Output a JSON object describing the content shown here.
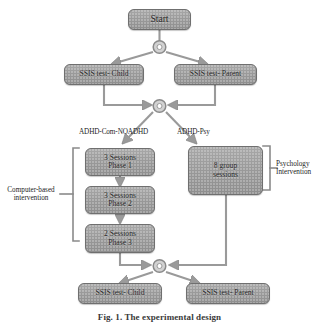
{
  "figure": {
    "caption": "Fig. 1. The experimental design",
    "type": "flowchart",
    "orientation": "top-to-bottom"
  },
  "palette": {
    "node_fill": "#9a9a9a",
    "node_border": "#6f6f6f",
    "connector": "#8f8f8f",
    "text": "#1d1d1d",
    "background": "#ffffff"
  },
  "nodes": {
    "start": {
      "label": "Start"
    },
    "ssis_child_pre": {
      "label": "SSIS test- Child"
    },
    "ssis_parent_pre": {
      "label": "SSIS test- Parent"
    },
    "phase1": {
      "line1": "3 Sessions",
      "line2": "Phase 1"
    },
    "phase2": {
      "line1": "3 Sessions",
      "line2": "Phase 2"
    },
    "phase3": {
      "line1": "2 Sessions",
      "line2": "Phase 3"
    },
    "group_sessions": {
      "line1": "8 group",
      "line2": "sessions"
    },
    "ssis_child_post": {
      "label": "SSIS test- Child"
    },
    "ssis_parent_post": {
      "label": "SSIS test- Parent"
    }
  },
  "edge_labels": {
    "left_branch": "ADHD-Com-NOADHD",
    "right_branch": "ADHD-Psy"
  },
  "group_labels": {
    "computer_based": {
      "line1": "Computer-based",
      "line2": "intervention"
    },
    "psychology": {
      "line1": "Psychology",
      "line2": "Intervention"
    }
  },
  "junctions": {
    "j_top": "split-junction",
    "j_middle": "merge-split-junction",
    "j_bottom": "merge-split-junction"
  }
}
